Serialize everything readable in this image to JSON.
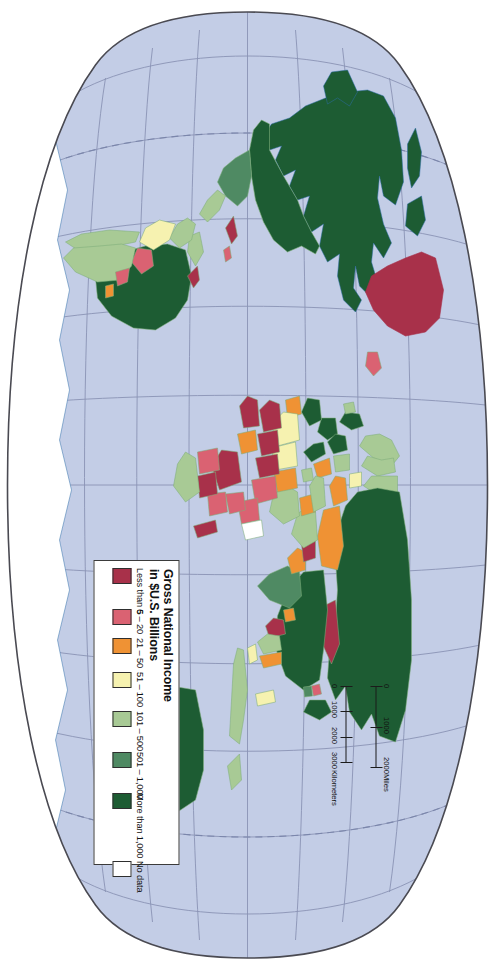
{
  "legend": {
    "title_line1": "Gross National Income",
    "title_line2": "in $U.S. Billions",
    "items": [
      {
        "label": "Less than 5",
        "color": "#a8314a"
      },
      {
        "label": "6 – 20",
        "color": "#da6272"
      },
      {
        "label": "21 – 50",
        "color": "#ef9234"
      },
      {
        "label": "51 – 100",
        "color": "#f6f2b0"
      },
      {
        "label": "101 – 500",
        "color": "#a8ca95"
      },
      {
        "label": "501 – 1,000",
        "color": "#4f8a63"
      },
      {
        "label": "More than 1,000",
        "color": "#1d5c33"
      },
      {
        "label": "No data",
        "color": "#ffffff"
      }
    ]
  },
  "scale": {
    "miles_unit": "Miles",
    "miles_ticks": [
      "0",
      "1000",
      "2000"
    ],
    "km_unit": "Kilometers",
    "km_ticks": [
      "0",
      "1000",
      "2000",
      "3000"
    ]
  },
  "map": {
    "ocean_color": "#c3cde6",
    "graticule_color": "#8a93b4",
    "dateline_color": "#7b86ab",
    "outline_color": "#4a4a52",
    "coast_color": "#2f6fa8",
    "border_color": "#7fae7a",
    "projection": "oval / pseudocylindrical world projection",
    "rotation_degrees": 90,
    "regions": [
      {
        "name": "Canada",
        "class": "More than 1,000"
      },
      {
        "name": "United States",
        "class": "More than 1,000"
      },
      {
        "name": "Greenland",
        "class": "Less than 5"
      },
      {
        "name": "Iceland",
        "class": "6 – 20"
      },
      {
        "name": "Mexico",
        "class": "501 – 1,000"
      },
      {
        "name": "Brazil",
        "class": "More than 1,000"
      },
      {
        "name": "Argentina",
        "class": "101 – 500"
      },
      {
        "name": "Chile",
        "class": "101 – 500"
      },
      {
        "name": "Peru",
        "class": "51 – 100"
      },
      {
        "name": "Colombia",
        "class": "101 – 500"
      },
      {
        "name": "Venezuela",
        "class": "101 – 500"
      },
      {
        "name": "Bolivia",
        "class": "6 – 20"
      },
      {
        "name": "Paraguay",
        "class": "6 – 20"
      },
      {
        "name": "Uruguay",
        "class": "6 – 20"
      },
      {
        "name": "Ecuador",
        "class": "21 – 50"
      },
      {
        "name": "Guyana",
        "class": "Less than 5"
      },
      {
        "name": "Suriname",
        "class": "Less than 5"
      },
      {
        "name": "United Kingdom",
        "class": "More than 1,000"
      },
      {
        "name": "France",
        "class": "More than 1,000"
      },
      {
        "name": "Germany",
        "class": "More than 1,000"
      },
      {
        "name": "Spain",
        "class": "More than 1,000"
      },
      {
        "name": "Italy",
        "class": "More than 1,000"
      },
      {
        "name": "Norway",
        "class": "101 – 500"
      },
      {
        "name": "Sweden",
        "class": "101 – 500"
      },
      {
        "name": "Finland",
        "class": "101 – 500"
      },
      {
        "name": "Poland",
        "class": "101 – 500"
      },
      {
        "name": "Netherlands",
        "class": "101 – 500"
      },
      {
        "name": "Russia",
        "class": "More than 1,000"
      },
      {
        "name": "Ukraine",
        "class": "51 – 100"
      },
      {
        "name": "Turkey",
        "class": "101 – 500"
      },
      {
        "name": "China",
        "class": "More than 1,000"
      },
      {
        "name": "India",
        "class": "501 – 1,000"
      },
      {
        "name": "Japan",
        "class": "More than 1,000"
      },
      {
        "name": "South Korea",
        "class": "501 – 1,000"
      },
      {
        "name": "North Korea",
        "class": "6 – 20"
      },
      {
        "name": "Mongolia",
        "class": "Less than 5"
      },
      {
        "name": "Kazakhstan",
        "class": "21 – 50"
      },
      {
        "name": "Iran",
        "class": "101 – 500"
      },
      {
        "name": "Saudi Arabia",
        "class": "101 – 500"
      },
      {
        "name": "Iraq",
        "class": "21 – 50"
      },
      {
        "name": "Pakistan",
        "class": "51 – 100"
      },
      {
        "name": "Bangladesh",
        "class": "51 – 100"
      },
      {
        "name": "Thailand",
        "class": "101 – 500"
      },
      {
        "name": "Vietnam",
        "class": "21 – 50"
      },
      {
        "name": "Indonesia",
        "class": "101 – 500"
      },
      {
        "name": "Malaysia",
        "class": "51 – 100"
      },
      {
        "name": "Philippines",
        "class": "51 – 100"
      },
      {
        "name": "Myanmar",
        "class": "Less than 5"
      },
      {
        "name": "Afghanistan",
        "class": "Less than 5"
      },
      {
        "name": "Australia",
        "class": "More than 1,000"
      },
      {
        "name": "New Zealand",
        "class": "101 – 500"
      },
      {
        "name": "Papua New Guinea",
        "class": "Less than 5"
      },
      {
        "name": "South Africa",
        "class": "101 – 500"
      },
      {
        "name": "Egypt",
        "class": "51 – 100"
      },
      {
        "name": "Nigeria",
        "class": "51 – 100"
      },
      {
        "name": "Algeria",
        "class": "51 – 100"
      },
      {
        "name": "Morocco",
        "class": "21 – 50"
      },
      {
        "name": "Libya",
        "class": "21 – 50"
      },
      {
        "name": "Sudan",
        "class": "6 – 20"
      },
      {
        "name": "Ethiopia",
        "class": "6 – 20"
      },
      {
        "name": "Kenya",
        "class": "6 – 20"
      },
      {
        "name": "Tanzania",
        "class": "6 – 20"
      },
      {
        "name": "Angola",
        "class": "6 – 20"
      },
      {
        "name": "Congo, Dem. Rep.",
        "class": "Less than 5"
      },
      {
        "name": "Chad",
        "class": "Less than 5"
      },
      {
        "name": "Niger",
        "class": "Less than 5"
      },
      {
        "name": "Mali",
        "class": "Less than 5"
      },
      {
        "name": "Somalia",
        "class": "No data"
      },
      {
        "name": "Antarctica",
        "class": "No data"
      }
    ]
  }
}
